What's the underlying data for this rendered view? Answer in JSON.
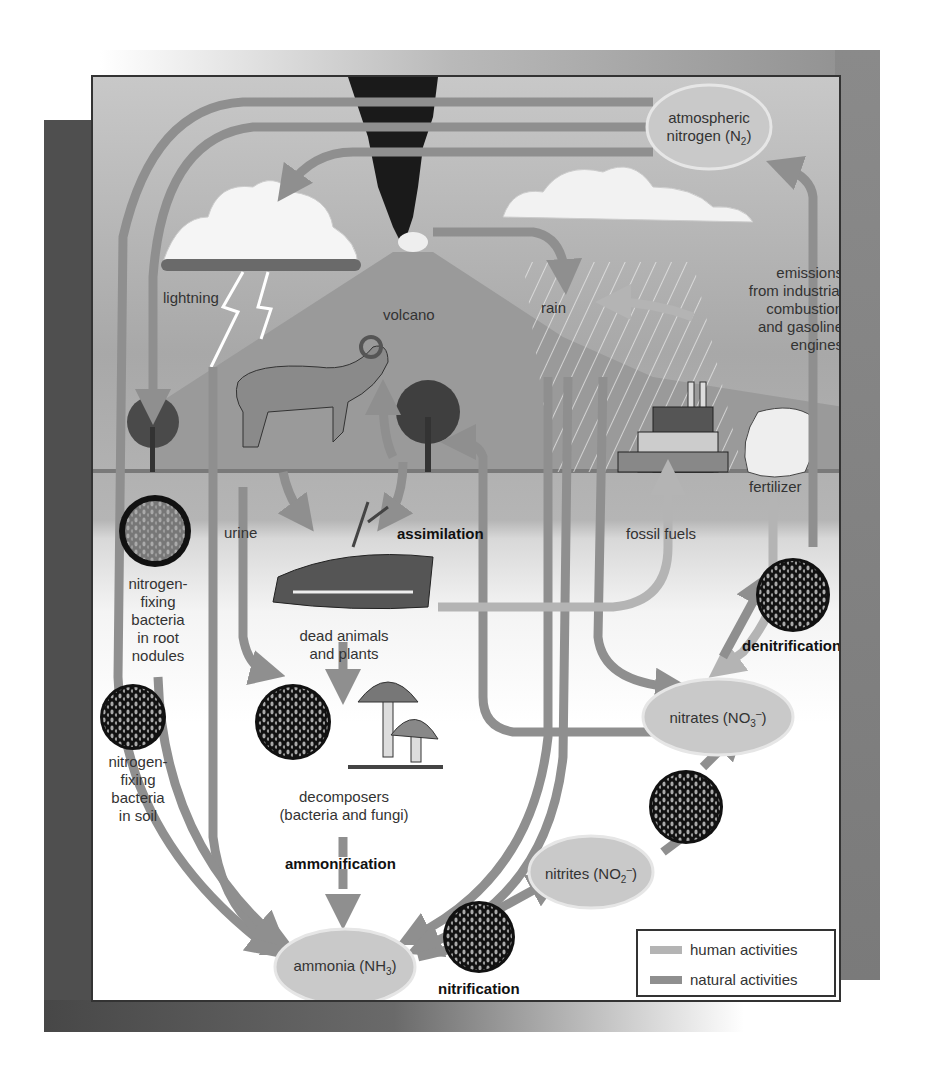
{
  "diagram": {
    "colors": {
      "human_activities": "#b4b4b4",
      "natural_activities": "#8f8f8f",
      "panel_border": "#333333",
      "cloud_fill": "#c9c9c9",
      "bacteria_disc": "#111111"
    },
    "pools": {
      "atmospheric_nitrogen": {
        "line1": "atmospheric",
        "line2": "nitrogen (N",
        "sub": "2",
        "tail": ")"
      },
      "nitrates": {
        "prefix": "nitrates (NO",
        "sub": "3",
        "sup": "–",
        "tail": ")"
      },
      "nitrites": {
        "prefix": "nitrites (NO",
        "sub": "2",
        "sup": "–",
        "tail": ")"
      },
      "ammonia": {
        "prefix": "ammonia (NH",
        "sub": "3",
        "tail": ")"
      }
    },
    "labels": {
      "lightning": "lightning",
      "volcano": "volcano",
      "rain": "rain",
      "emissions": [
        "emissions",
        "from industrial",
        "combustion",
        "and gasoline",
        "engines"
      ],
      "fertilizer": "fertilizer",
      "fossil_fuels": "fossil fuels",
      "urine": "urine",
      "assimilation": "assimilation",
      "dead_matter": [
        "dead animals",
        "and plants"
      ],
      "decomposers": [
        "decomposers",
        "(bacteria and fungi)"
      ],
      "ammonification": "ammonification",
      "nitrification": "nitrification",
      "denitrification": "denitrification",
      "root_bacteria": [
        "nitrogen-",
        "fixing",
        "bacteria",
        "in root",
        "nodules"
      ],
      "soil_bacteria": [
        "nitrogen-",
        "fixing",
        "bacteria",
        "in soil"
      ]
    },
    "legend": [
      {
        "label": "human activities",
        "color": "#b4b4b4"
      },
      {
        "label": "natural activities",
        "color": "#8f8f8f"
      }
    ]
  }
}
